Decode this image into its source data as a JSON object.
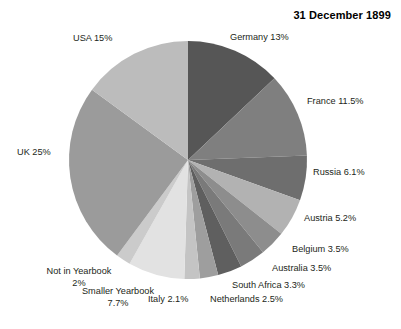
{
  "chart_data": {
    "type": "pie",
    "title": "31 December 1899",
    "xlabel": "",
    "ylabel": "",
    "legend_position": "none",
    "grid": false,
    "start_angle_deg": 0,
    "direction": "clockwise",
    "categories": [
      "Germany",
      "France",
      "Russia",
      "Austria",
      "Belgium",
      "Australia",
      "South Africa",
      "Netherlands",
      "Italy",
      "Smaller Yearbook",
      "Not in Yearbook",
      "UK",
      "USA"
    ],
    "values": [
      13,
      11.5,
      6.1,
      5.2,
      3.5,
      3.5,
      3.3,
      2.5,
      2.1,
      7.7,
      2,
      25,
      15
    ],
    "value_unit": "%",
    "colors": [
      "#565656",
      "#7f7f7f",
      "#6e6e6e",
      "#b2b2b2",
      "#8d8d8d",
      "#7a7a7a",
      "#5f5f5f",
      "#9e9e9e",
      "#c4c4c4",
      "#e2e2e2",
      "#cbcbcb",
      "#9b9b9b",
      "#bcbcbc"
    ],
    "slices": [
      {
        "label": "Germany 13%",
        "name": "Germany",
        "value": 13,
        "color": "#565656"
      },
      {
        "label": "France 11.5%",
        "name": "France",
        "value": 11.5,
        "color": "#7f7f7f"
      },
      {
        "label": "Russia 6.1%",
        "name": "Russia",
        "value": 6.1,
        "color": "#6e6e6e"
      },
      {
        "label": "Austria 5.2%",
        "name": "Austria",
        "value": 5.2,
        "color": "#b2b2b2"
      },
      {
        "label": "Belgium 3.5%",
        "name": "Belgium",
        "value": 3.5,
        "color": "#8d8d8d"
      },
      {
        "label": "Australia 3.5%",
        "name": "Australia",
        "value": 3.5,
        "color": "#7a7a7a"
      },
      {
        "label": "South Africa 3.3%",
        "name": "South Africa",
        "value": 3.3,
        "color": "#5f5f5f"
      },
      {
        "label": "Netherlands 2.5%",
        "name": "Netherlands",
        "value": 2.5,
        "color": "#9e9e9e"
      },
      {
        "label": "Italy 2.1%",
        "name": "Italy",
        "value": 2.1,
        "color": "#c4c4c4"
      },
      {
        "label": "Smaller Yearbook 7.7%",
        "name": "Smaller Yearbook",
        "value": 7.7,
        "color": "#e2e2e2"
      },
      {
        "label": "Not in Yearbook 2%",
        "name": "Not in Yearbook",
        "value": 2,
        "color": "#cbcbcb"
      },
      {
        "label": "UK 25%",
        "name": "UK",
        "value": 25,
        "color": "#9b9b9b"
      },
      {
        "label": "USA 15%",
        "name": "USA",
        "value": 15,
        "color": "#bcbcbc"
      }
    ]
  },
  "labels": {
    "germany": "Germany 13%",
    "france": "France 11.5%",
    "russia": "Russia 6.1%",
    "austria": "Austria 5.2%",
    "belgium": "Belgium 3.5%",
    "australia": "Australia 3.5%",
    "south_africa": "South Africa 3.3%",
    "netherlands": "Netherlands 2.5%",
    "italy": "Italy 2.1%",
    "smaller_yearbook_line1": "Smaller Yearbook",
    "smaller_yearbook_line2": "7.7%",
    "not_in_yearbook_line1": "Not in Yearbook",
    "not_in_yearbook_line2": "2%",
    "uk": "UK 25%",
    "usa": "USA 15%"
  }
}
